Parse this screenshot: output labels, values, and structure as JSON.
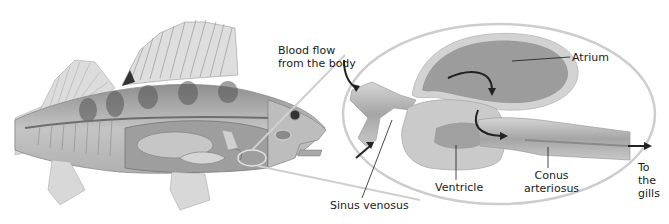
{
  "diagram": {
    "colors": {
      "background": "#ffffff",
      "callout_outline": "#c9c9c9",
      "heart_outer": "#cfcfcf",
      "heart_inner": "#a9a9a9",
      "atrium_fill": "#9a9a9a",
      "arrow": "#222222",
      "text": "#1a1a1a"
    },
    "labels": {
      "blood_flow_line1": "Blood flow",
      "blood_flow_line2": "from the body",
      "atrium": "Atrium",
      "sinus_venosus": "Sinus venosus",
      "ventricle": "Ventricle",
      "conus_line1": "Conus",
      "conus_line2": "arteriosus",
      "gills_line1": "To",
      "gills_line2": "the",
      "gills_line3": "gills"
    },
    "figures": {
      "fish": "Cutaway illustration of a perch showing internal organs",
      "callout": "Enlarged oval view of the heart"
    }
  }
}
